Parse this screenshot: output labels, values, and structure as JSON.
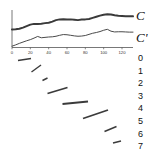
{
  "chart_data": {
    "type": "line",
    "title": "",
    "xlabel": "",
    "ylabel": "",
    "xlim": [
      0,
      132
    ],
    "ylim": [
      0,
      10
    ],
    "grid": false,
    "legend_position": "right",
    "xticks": [
      0,
      20,
      40,
      60,
      80,
      100,
      120
    ],
    "xtick_labels": [
      "0",
      "20",
      "40",
      "60",
      "80",
      "100",
      "120"
    ],
    "series": [
      {
        "name": "C",
        "label": "C",
        "color": "#3a3a3a",
        "linewidth": 2.0,
        "x": [
          0,
          4,
          8,
          12,
          16,
          20,
          24,
          28,
          32,
          36,
          40,
          44,
          48,
          52,
          56,
          60,
          64,
          68,
          72,
          76,
          80,
          84,
          88,
          92,
          96,
          100,
          104,
          108,
          112,
          116,
          120,
          124,
          128,
          132
        ],
        "y": [
          4.8,
          4.85,
          5.0,
          5.3,
          5.7,
          6.1,
          6.3,
          6.25,
          6.35,
          6.5,
          6.6,
          6.9,
          7.3,
          7.5,
          7.55,
          7.45,
          7.5,
          7.4,
          7.3,
          7.45,
          7.5,
          7.6,
          7.9,
          8.2,
          8.5,
          8.75,
          8.85,
          8.8,
          8.6,
          8.45,
          8.4,
          8.35,
          8.35,
          8.3
        ]
      },
      {
        "name": "C'",
        "label": "C'",
        "color": "#4a4a4a",
        "linewidth": 1.0,
        "x": [
          0,
          4,
          8,
          12,
          16,
          20,
          24,
          28,
          32,
          36,
          40,
          44,
          48,
          52,
          56,
          60,
          64,
          68,
          72,
          76,
          80,
          84,
          88,
          92,
          96,
          100,
          104,
          108,
          112,
          116,
          120,
          124,
          128,
          132
        ],
        "y": [
          0.35,
          0.7,
          1.1,
          1.45,
          1.8,
          2.1,
          2.5,
          2.95,
          2.6,
          2.7,
          2.8,
          2.85,
          3.0,
          3.25,
          3.45,
          3.4,
          3.25,
          3.1,
          3.0,
          3.05,
          3.2,
          3.5,
          3.8,
          4.0,
          4.25,
          4.6,
          4.85,
          4.35,
          4.15,
          4.2,
          4.2,
          4.15,
          4.1,
          4.1
        ]
      }
    ],
    "segments": {
      "count": 8,
      "numbers": [
        "0",
        "1",
        "2",
        "3",
        "4",
        "5",
        "6",
        "7"
      ],
      "color": "#3b3b3b",
      "items": [
        {
          "id": "0",
          "x1": 18.0,
          "y1": 60.5,
          "x2": 31.0,
          "y2": 58.5,
          "width": 1.6
        },
        {
          "id": "1",
          "x1": 31.5,
          "y1": 72.0,
          "x2": 41.0,
          "y2": 65.0,
          "width": 1.4
        },
        {
          "id": "2",
          "x1": 42.5,
          "y1": 80.5,
          "x2": 47.5,
          "y2": 78.0,
          "width": 1.5
        },
        {
          "id": "3",
          "x1": 47.5,
          "y1": 93.5,
          "x2": 67.5,
          "y2": 87.5,
          "width": 1.8
        },
        {
          "id": "4",
          "x1": 62.5,
          "y1": 104.0,
          "x2": 88.0,
          "y2": 101.5,
          "width": 1.9
        },
        {
          "id": "5",
          "x1": 83.0,
          "y1": 118.5,
          "x2": 108.0,
          "y2": 110.0,
          "width": 1.8
        },
        {
          "id": "6",
          "x1": 104.5,
          "y1": 131.5,
          "x2": 116.5,
          "y2": 126.5,
          "width": 1.5
        },
        {
          "id": "7",
          "x1": 113.0,
          "y1": 143.0,
          "x2": 121.0,
          "y2": 141.0,
          "width": 1.5
        }
      ]
    }
  },
  "labels": {
    "curve_top": "C",
    "curve_bottom": "C'"
  }
}
